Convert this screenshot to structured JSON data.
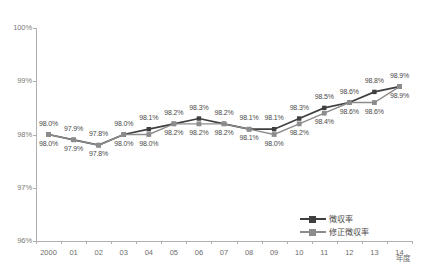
{
  "chart_data": {
    "type": "line",
    "title": "",
    "xlabel": "年度",
    "ylabel": "",
    "ylim": [
      96,
      100
    ],
    "yticks": [
      "96%",
      "97%",
      "98%",
      "99%",
      "100%"
    ],
    "ytick_values": [
      96,
      97,
      98,
      99,
      100
    ],
    "grid": false,
    "legend_position": "bottom-right",
    "categories": [
      "2000",
      "01",
      "02",
      "03",
      "04",
      "05",
      "06",
      "07",
      "08",
      "09",
      "10",
      "11",
      "12",
      "13",
      "14"
    ],
    "series": [
      {
        "name": "徴収率",
        "color": "#3f3f3f",
        "marker": "square",
        "values": [
          98.0,
          97.9,
          97.8,
          98.0,
          98.1,
          98.2,
          98.3,
          98.2,
          98.1,
          98.1,
          98.3,
          98.5,
          98.6,
          98.8,
          98.9
        ],
        "labels": [
          "98.0%",
          "97.9%",
          "97.8%",
          "98.0%",
          "98.1%",
          "98.2%",
          "98.3%",
          "98.2%",
          "98.1%",
          "98.1%",
          "98.3%",
          "98.5%",
          "98.6%",
          "98.8%",
          "98.9%"
        ]
      },
      {
        "name": "修正徴収率",
        "color": "#8c8c8c",
        "marker": "square",
        "values": [
          98.0,
          97.9,
          97.8,
          98.0,
          98.0,
          98.2,
          98.2,
          98.2,
          98.1,
          98.0,
          98.2,
          98.4,
          98.6,
          98.6,
          98.9
        ],
        "labels": [
          "98.0%",
          "97.9%",
          "97.8%",
          "98.0%",
          "98.0%",
          "98.2%",
          "98.2%",
          "98.2%",
          "98.1%",
          "98.0%",
          "98.2%",
          "98.4%",
          "98.6%",
          "98.6%",
          "98.9%"
        ]
      }
    ]
  }
}
